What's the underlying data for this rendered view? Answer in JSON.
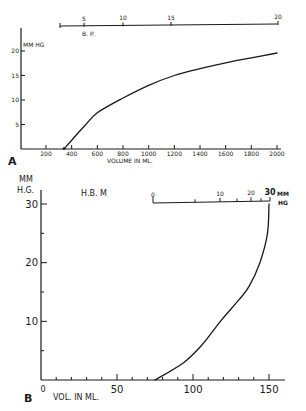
{
  "chart_data": [
    {
      "panel": "A",
      "type": "line",
      "xlabel": "VOLUME IN ML.",
      "ylabel": "MM HG",
      "x_ticks": [
        200,
        400,
        600,
        800,
        1000,
        1200,
        1400,
        1600,
        1800,
        2000
      ],
      "x_tick_labels": [
        "200",
        "400",
        "600",
        "800",
        "1000",
        "1200",
        "1400",
        "1600",
        "1800",
        "2000"
      ],
      "y_ticks": [
        5,
        10,
        15,
        20
      ],
      "y_tick_labels": [
        "5",
        "10",
        "15",
        "20"
      ],
      "xlim": [
        0,
        2000
      ],
      "ylim": [
        0,
        25
      ],
      "x": [
        340,
        400,
        500,
        600,
        800,
        1000,
        1200,
        1400,
        1600,
        1800,
        2000
      ],
      "y": [
        0,
        1.8,
        4.7,
        7.4,
        10.4,
        13.0,
        15.0,
        16.4,
        17.6,
        18.6,
        19.6
      ],
      "secondary_axis": {
        "label": "B. P.",
        "ticks": [
          5,
          10,
          15,
          20
        ],
        "tick_labels": [
          "5",
          "10",
          "15",
          "20"
        ]
      },
      "grid": false
    },
    {
      "panel": "B",
      "type": "line",
      "title": "H.B.  M",
      "xlabel": "VOL. IN ML.",
      "ylabel": "MM HG.",
      "x_ticks": [
        0,
        50,
        100,
        150
      ],
      "x_tick_labels": [
        "0",
        "50",
        "100",
        "150"
      ],
      "y_ticks": [
        10,
        20,
        30
      ],
      "y_tick_labels": [
        "10",
        "20",
        "30"
      ],
      "xlim": [
        0,
        160
      ],
      "ylim": [
        0,
        33
      ],
      "x": [
        75,
        94,
        106,
        118,
        130,
        137,
        144,
        149,
        150
      ],
      "y": [
        0,
        3,
        6,
        10,
        13.6,
        16,
        20,
        25,
        30
      ],
      "secondary_axis": {
        "label": "MM HG",
        "ticks": [
          0,
          10,
          20,
          30
        ],
        "tick_labels": [
          "0",
          "10",
          "20",
          "30"
        ]
      },
      "grid": false
    }
  ],
  "labels": {
    "panel_a": "A",
    "panel_b": "B",
    "a_ylabel": "MM HG",
    "a_xlabel": "VOLUME IN ML.",
    "a_top_label": "B. P.",
    "b_ylabel_1": "MM",
    "b_ylabel_2": "H.G.",
    "b_title": "H.B.  M",
    "b_xlabel": "VOL. IN ML.",
    "b_inset_unit_1": "MM",
    "b_inset_unit_2": "HG"
  }
}
